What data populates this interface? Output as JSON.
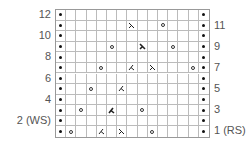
{
  "chart": {
    "columns": 15,
    "rows": 12,
    "row_labels_left": [
      {
        "row": 12,
        "text": "12"
      },
      {
        "row": 10,
        "text": "10"
      },
      {
        "row": 8,
        "text": "8"
      },
      {
        "row": 6,
        "text": "6"
      },
      {
        "row": 4,
        "text": "4"
      },
      {
        "row": 2,
        "text": "2 (WS)"
      }
    ],
    "row_labels_right": [
      {
        "row": 11,
        "text": "11"
      },
      {
        "row": 9,
        "text": "9"
      },
      {
        "row": 7,
        "text": "7"
      },
      {
        "row": 5,
        "text": "5"
      },
      {
        "row": 3,
        "text": "3"
      },
      {
        "row": 1,
        "text": "1 (RS)"
      }
    ],
    "edge_stitch": "purl",
    "symbols": [
      {
        "row": 1,
        "col": 2,
        "type": "yo"
      },
      {
        "row": 1,
        "col": 5,
        "type": "k2tog"
      },
      {
        "row": 1,
        "col": 7,
        "type": "ssk"
      },
      {
        "row": 1,
        "col": 10,
        "type": "yo"
      },
      {
        "row": 3,
        "col": 3,
        "type": "yo"
      },
      {
        "row": 3,
        "col": 6,
        "type": "k2tog-bold"
      },
      {
        "row": 3,
        "col": 9,
        "type": "yo"
      },
      {
        "row": 5,
        "col": 4,
        "type": "yo"
      },
      {
        "row": 5,
        "col": 7,
        "type": "k2tog"
      },
      {
        "row": 7,
        "col": 5,
        "type": "yo"
      },
      {
        "row": 7,
        "col": 8,
        "type": "k2tog"
      },
      {
        "row": 7,
        "col": 10,
        "type": "ssk"
      },
      {
        "row": 7,
        "col": 14,
        "type": "yo"
      },
      {
        "row": 9,
        "col": 6,
        "type": "yo"
      },
      {
        "row": 9,
        "col": 9,
        "type": "ssk-bold"
      },
      {
        "row": 9,
        "col": 12,
        "type": "yo"
      },
      {
        "row": 11,
        "col": 8,
        "type": "ssk"
      },
      {
        "row": 11,
        "col": 11,
        "type": "yo"
      }
    ]
  }
}
